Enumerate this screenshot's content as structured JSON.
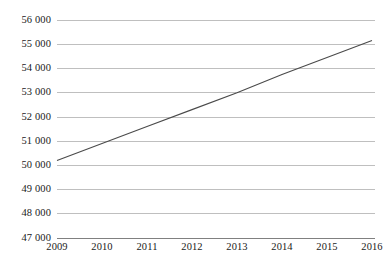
{
  "chart_data": {
    "type": "line",
    "title": "",
    "subtitle": "",
    "xlabel": "",
    "ylabel": "",
    "categories": [
      "2009",
      "2010",
      "2011",
      "2012",
      "2013",
      "2014",
      "2015",
      "2016"
    ],
    "x": [
      2009,
      2010,
      2011,
      2012,
      2013,
      2014,
      2015,
      2016
    ],
    "series": [
      {
        "name": "",
        "values": [
          50200,
          50900,
          51600,
          52300,
          53000,
          53750,
          54450,
          55150
        ],
        "color": "#4a4a4a"
      }
    ],
    "ylim": [
      47000,
      56000
    ],
    "ytick_values": [
      56000,
      55000,
      54000,
      53000,
      52000,
      51000,
      50000,
      49000,
      48000,
      47000
    ],
    "ytick_labels": [
      "56 000",
      "55 000",
      "54 000",
      "53 000",
      "52 000",
      "51 000",
      "50 000",
      "49 000",
      "48 000",
      "47 000"
    ],
    "ystep": 1000,
    "grid": true,
    "grid_color": "#bfbfbf",
    "axis_color": "#808080",
    "legend": "none",
    "legend_position": "none",
    "background": "#ffffff",
    "annotations": []
  },
  "axes": {
    "y_labels": [
      "56 000",
      "55 000",
      "54 000",
      "53 000",
      "52 000",
      "51 000",
      "50 000",
      "49 000",
      "48 000",
      "47 000"
    ],
    "x_labels": [
      "2009",
      "2010",
      "2011",
      "2012",
      "2013",
      "2014",
      "2015",
      "2016"
    ]
  }
}
